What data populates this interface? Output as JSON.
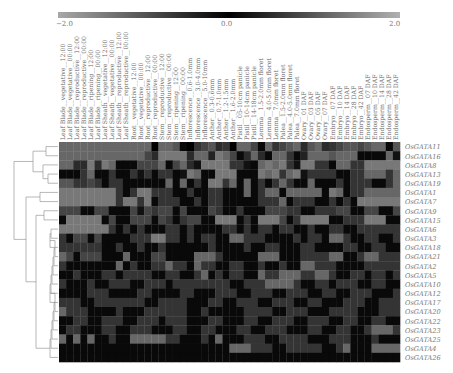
{
  "chart_data": {
    "type": "heatmap",
    "title": "",
    "colorbar": {
      "min": -2.0,
      "max": 2.0,
      "ticks": [
        "−2.0",
        "0.0",
        "2.0"
      ],
      "colormap": "gray-black-gray",
      "low_color": "#a8a8a8",
      "mid_color": "#000000",
      "high_color": "#b0b0b0"
    },
    "columns": [
      "Leaf Blade_vegetative_12:00",
      "Leaf Blade_vegetative_00:00",
      "Leaf Blade_reproductive_12:00",
      "Leaf Blade_reproductive_00:00",
      "Leaf Blade_ripening_12:00",
      "Leaf Blade_ripening_00:00",
      "Leaf Sheath_vegetative_12:00",
      "Leaf Sheath_vegetative_00:00",
      "Leaf Sheath_reproductive_12:00",
      "Leaf Sheath_reproductive_00:00",
      "Root_vegetative_12:00",
      "Root_vegetative_00:00",
      "Root_reproductive_12:00",
      "Root_reproductive_00:00",
      "Stem_reproductive_12:00",
      "Stem_reproductive_00:00",
      "Stem_ripening_12:00",
      "Stem_ripening_00:00",
      "Inflorescence_0.6-1.0mm",
      "Inflorescence_3.0-4.0mm",
      "Inflorescence_5.0-10mm",
      "Anther_0.3-0.6mm",
      "Anther_0.7-1.0mm",
      "Anther_1.2-1.5mm",
      "Anther_1.6-2.0mm",
      "Pistil_05-10cm panicle",
      "Pistil_10-14cm panicle",
      "Pistil_14-18cm panicle",
      "Lemma_1.5-2.0mm floret",
      "Lemma_4.0-5.0mm floret",
      "Lemma_7.0mm floret",
      "Palea_1.5-2.0mm floret",
      "Palea_4.0-5.0mm floret",
      "Palea_7.0mm floret",
      "Ovary_01 DAF",
      "Ovary_03 DAF",
      "Ovary_05 DAF",
      "Ovary_07 DAF",
      "Embryo_07 DAF",
      "Embryo_10 DAF",
      "Embryo_14 DAF",
      "Embryo_28 DAF",
      "Embryo_42 DAF",
      "Endosperm_07 DAF",
      "Endosperm_10 DAF",
      "Endosperm_14 DAF",
      "Endosperm_28 DAF",
      "Endosperm_42 DAF"
    ],
    "rows": [
      "OsGATA11",
      "OsGATA16",
      "OsGATA8",
      "OsGATA13",
      "OsGATA19",
      "OsGATA1",
      "OsGATA7",
      "OsGATA9",
      "OsGATA15",
      "OsGATA6",
      "OsGATA3",
      "OsGATA18",
      "OsGATA21",
      "OsGATA2",
      "OsGATA5",
      "OsGATA10",
      "OsGATA12",
      "OsGATA17",
      "OsGATA20",
      "OsGATA22",
      "OsGATA23",
      "OsGATA25",
      "OsGATA4",
      "OsGATA26"
    ],
    "values": [
      [
        -1.2,
        -1.2,
        -1.2,
        -1.2,
        -1.2,
        -1.2,
        -1.2,
        -1.2,
        -1.2,
        -1.2,
        -1.2,
        -1.2,
        -1.2,
        0.0,
        -1.2,
        -1.2,
        -1.0,
        0.1,
        0.0,
        -0.6,
        -0.8,
        -1.0,
        -0.5,
        -0.6,
        0.0,
        -1.2,
        -1.2,
        -0.8,
        0.1,
        -1.2,
        -0.6,
        -0.8,
        -1.0,
        -1.2,
        -0.5,
        -1.0,
        -1.2,
        -0.5,
        -0.6,
        -0.8,
        -1.0,
        -1.0,
        -0.8,
        -1.0,
        -1.2,
        -1.2,
        -0.1,
        -1.0
      ],
      [
        -1.2,
        -1.2,
        -1.2,
        -1.2,
        -1.2,
        -1.2,
        -1.2,
        -1.2,
        -1.2,
        -1.2,
        -1.2,
        -1.2,
        -0.8,
        -0.5,
        -1.4,
        -1.4,
        -1.4,
        -1.4,
        -0.5,
        -1.2,
        -1.2,
        -0.4,
        -1.4,
        -1.2,
        -0.8,
        -0.1,
        -0.5,
        -1.2,
        -0.5,
        -0.1,
        -1.2,
        -1.2,
        -0.6,
        -0.1,
        -0.4,
        -1.2,
        -1.2,
        -1.2,
        -1.0,
        -1.2,
        -1.2,
        -1.2,
        -0.1,
        -0.1,
        -0.1,
        -0.1,
        -1.2,
        -0.2
      ],
      [
        -1.2,
        -1.2,
        -0.5,
        -0.5,
        -1.4,
        -0.5,
        -1.4,
        -1.2,
        -0.1,
        -0.1,
        -0.1,
        -0.8,
        -0.8,
        -0.8,
        -1.2,
        -0.1,
        -0.8,
        -1.2,
        -0.5,
        -0.2,
        -1.4,
        -1.4,
        -1.4,
        -1.4,
        -0.6,
        -0.6,
        -0.2,
        -0.1,
        -1.2,
        -1.4,
        -1.2,
        -1.4,
        -0.6,
        -0.2,
        -1.4,
        -1.4,
        -0.6,
        -0.6,
        -0.1,
        -1.2,
        -1.2,
        -0.6,
        -0.6,
        -1.4,
        -1.4,
        -1.4,
        -1.4,
        -1.4
      ],
      [
        -0.1,
        -0.1,
        -0.1,
        -0.6,
        -1.2,
        -0.1,
        -0.1,
        -0.6,
        -0.1,
        -0.1,
        -0.6,
        -0.2,
        -0.6,
        -0.1,
        -0.6,
        -0.6,
        -0.1,
        -0.2,
        -1.4,
        -1.2,
        -0.1,
        -0.1,
        -1.4,
        -1.4,
        -1.4,
        -0.1,
        -0.1,
        -0.1,
        -1.4,
        -1.2,
        -1.4,
        -0.6,
        -1.2,
        -1.4,
        -0.2,
        -0.6,
        -0.6,
        -0.6,
        -0.6,
        -0.1,
        -0.1,
        -0.6,
        -0.6,
        -1.2,
        -1.2,
        -1.2,
        -0.6,
        -1.2
      ],
      [
        -1.0,
        -1.0,
        -0.6,
        -0.6,
        -0.8,
        -0.6,
        -0.1,
        -0.6,
        -0.6,
        -0.1,
        -0.1,
        -0.1,
        -0.1,
        -0.1,
        -0.1,
        -1.2,
        -0.1,
        -1.2,
        -0.1,
        -0.6,
        -0.1,
        -1.4,
        -1.4,
        -0.6,
        -1.2,
        -0.1,
        -1.2,
        -0.1,
        -0.6,
        -0.1,
        -0.6,
        -1.2,
        -0.6,
        -0.1,
        -0.1,
        -1.2,
        -0.1,
        -0.1,
        -0.1,
        -0.6,
        -0.1,
        -0.6,
        -0.6,
        -0.6,
        -0.1,
        -0.1,
        -0.6,
        -1.2
      ],
      [
        -1.4,
        -1.4,
        -1.4,
        -1.4,
        -1.4,
        -1.4,
        -1.4,
        -1.4,
        -0.6,
        -0.1,
        -0.6,
        -1.4,
        -1.4,
        -0.6,
        -0.6,
        -0.6,
        -0.1,
        -0.1,
        -0.6,
        -0.1,
        -0.1,
        -0.6,
        -0.6,
        -0.1,
        -0.1,
        -0.1,
        -1.2,
        -0.1,
        -0.6,
        -1.2,
        -1.2,
        -0.1,
        -1.2,
        -1.2,
        -1.2,
        -1.2,
        -1.2,
        -0.1,
        -1.4,
        -1.2,
        -0.1,
        -0.6,
        -0.6,
        -1.2,
        -1.2,
        -1.2,
        -1.2,
        -1.2
      ],
      [
        -1.4,
        -1.4,
        -1.4,
        -1.4,
        -1.4,
        -1.4,
        -1.4,
        -1.4,
        -0.6,
        -1.4,
        -1.4,
        -0.6,
        -1.4,
        -0.1,
        -0.6,
        -0.6,
        -0.6,
        -0.1,
        -0.1,
        -0.6,
        -0.1,
        -0.6,
        -0.6,
        -0.1,
        -0.1,
        -0.1,
        -0.1,
        -0.1,
        -0.6,
        -0.6,
        -0.6,
        -1.2,
        -0.1,
        -0.6,
        -0.6,
        -0.6,
        -0.1,
        -0.1,
        -0.6,
        -0.1,
        -0.6,
        -0.1,
        -1.4,
        -1.4,
        -1.4,
        -1.4,
        -1.4,
        -1.4
      ],
      [
        -0.8,
        -0.8,
        -0.8,
        -0.1,
        -0.1,
        -0.8,
        -0.8,
        -0.1,
        -0.1,
        -0.1,
        -0.8,
        -0.2,
        -0.8,
        -0.6,
        -0.8,
        -0.8,
        -0.1,
        -0.8,
        -0.1,
        -0.1,
        -0.1,
        -0.8,
        -0.6,
        -0.1,
        -0.1,
        -0.6,
        -0.1,
        -0.1,
        -0.1,
        -0.8,
        -0.8,
        -0.8,
        -0.6,
        -0.6,
        -0.1,
        -0.1,
        -0.6,
        -0.6,
        -0.6,
        -0.8,
        -0.8,
        -0.1,
        -0.1,
        -0.8,
        -0.8,
        -0.1,
        -0.1,
        -0.8
      ],
      [
        -0.1,
        -1.4,
        -1.4,
        -1.4,
        -1.4,
        -1.4,
        -0.1,
        -0.8,
        -0.1,
        -0.1,
        -0.8,
        -0.8,
        -0.8,
        -0.1,
        -0.8,
        -0.6,
        -0.1,
        -0.6,
        -0.8,
        -0.8,
        -0.1,
        -0.1,
        -1.4,
        -1.4,
        -1.4,
        -0.1,
        -0.6,
        -0.1,
        -1.4,
        -1.4,
        -1.4,
        -0.8,
        -0.1,
        -0.6,
        -1.4,
        -1.4,
        -1.4,
        -1.4,
        -0.1,
        -0.1,
        -0.6,
        -0.6,
        -0.6,
        -1.4,
        -1.4,
        -1.4,
        -0.1,
        -0.1
      ],
      [
        -1.4,
        -1.4,
        -1.4,
        -1.4,
        -1.4,
        -1.4,
        -1.4,
        -0.6,
        -0.1,
        -0.6,
        -0.1,
        -0.6,
        -0.1,
        -0.1,
        -0.1,
        -0.6,
        -0.6,
        -0.1,
        -0.6,
        -0.1,
        -0.1,
        -0.1,
        -0.1,
        -0.6,
        -0.6,
        -0.1,
        -0.6,
        -0.1,
        -0.6,
        -0.6,
        -0.1,
        -0.6,
        -0.6,
        -0.1,
        -0.1,
        -0.6,
        -0.1,
        -0.1,
        -0.6,
        -0.6,
        -0.1,
        -0.1,
        -0.6,
        -0.6,
        -0.6,
        -0.6,
        -0.6,
        -0.6
      ],
      [
        -0.6,
        -0.1,
        -0.8,
        -0.8,
        -0.1,
        -0.8,
        -0.1,
        -0.1,
        -0.1,
        -0.1,
        -0.6,
        -0.6,
        -0.6,
        -1.4,
        -1.4,
        -0.6,
        -0.6,
        -0.1,
        -0.6,
        -0.1,
        -0.6,
        -0.6,
        -0.1,
        -0.1,
        -1.2,
        -1.2,
        -0.6,
        -0.6,
        -0.6,
        -0.1,
        -0.1,
        -0.1,
        -0.1,
        -0.6,
        -0.1,
        -0.6,
        -0.6,
        -0.1,
        -1.2,
        -1.2,
        -0.6,
        -0.1,
        -0.1,
        -0.6,
        -0.6,
        -0.1,
        -0.1,
        -0.6
      ],
      [
        -0.6,
        -0.6,
        -0.6,
        -0.6,
        -0.6,
        -0.6,
        -0.1,
        -0.1,
        -0.6,
        -0.1,
        -0.1,
        -0.6,
        -0.1,
        -0.1,
        -0.6,
        -0.1,
        -0.1,
        -0.1,
        -0.1,
        -0.1,
        -0.1,
        -0.6,
        -0.1,
        -0.1,
        -0.1,
        -0.1,
        -0.6,
        -0.1,
        -0.1,
        -0.6,
        -0.6,
        -0.1,
        -0.1,
        -0.1,
        -0.6,
        -0.6,
        -0.1,
        -0.1,
        -0.1,
        -0.1,
        -0.6,
        -0.6,
        -0.1,
        -0.1,
        -0.6,
        -0.6,
        -0.1,
        -0.1
      ],
      [
        -1.2,
        -0.8,
        -0.1,
        -0.8,
        -0.8,
        -0.8,
        -0.1,
        -0.1,
        -0.1,
        -1.2,
        -0.1,
        -0.1,
        -0.1,
        -0.8,
        -0.8,
        -0.1,
        -0.1,
        -0.1,
        -0.1,
        -1.2,
        -1.2,
        -1.2,
        -0.6,
        -0.1,
        -0.1,
        -0.1,
        -0.1,
        -0.1,
        -1.2,
        -1.2,
        -1.2,
        -0.1,
        -0.1,
        -0.1,
        -0.6,
        -0.6,
        -0.6,
        -0.6,
        -1.2,
        -1.2,
        -0.1,
        -0.1,
        -0.6,
        -1.2,
        -1.2,
        -0.6,
        -0.6,
        -0.6
      ],
      [
        -0.6,
        -0.1,
        -0.1,
        -0.1,
        -0.1,
        -0.1,
        -0.1,
        -0.1,
        -1.2,
        -0.1,
        -0.6,
        -0.1,
        -0.1,
        -0.6,
        -0.6,
        -1.2,
        -0.6,
        -0.6,
        -0.1,
        -1.2,
        -0.6,
        -0.6,
        -0.1,
        -0.1,
        -0.6,
        -0.6,
        -0.1,
        -0.1,
        -0.6,
        -0.1,
        -0.1,
        -0.6,
        -0.1,
        -0.1,
        -1.2,
        -1.2,
        -0.6,
        -0.6,
        -0.6,
        -0.1,
        -0.1,
        -0.1,
        -0.1,
        -0.6,
        -0.6,
        -0.6,
        -0.6,
        -0.6
      ],
      [
        -0.1,
        -0.1,
        -0.6,
        -0.1,
        -0.1,
        -0.1,
        -0.6,
        -0.6,
        -0.1,
        -0.6,
        -0.6,
        -0.6,
        -0.6,
        -0.1,
        -0.1,
        -0.6,
        -0.6,
        -0.1,
        -0.1,
        -0.6,
        -1.2,
        -0.1,
        -0.6,
        -0.1,
        -0.6,
        -0.6,
        -0.1,
        -0.1,
        -1.2,
        -0.6,
        -0.6,
        -1.2,
        -1.2,
        -1.2,
        -0.6,
        -0.6,
        -1.2,
        -1.2,
        -0.6,
        -0.1,
        -0.1,
        -0.6,
        -0.6,
        -0.1,
        -0.6,
        -0.6,
        -0.1,
        -0.6
      ],
      [
        -0.6,
        -0.1,
        -0.1,
        -0.1,
        -0.6,
        -0.1,
        -0.1,
        -0.6,
        -0.6,
        -0.6,
        -0.1,
        -0.1,
        -0.6,
        -0.6,
        -0.6,
        -0.1,
        -0.6,
        -0.6,
        -0.6,
        -0.6,
        -0.6,
        -0.6,
        -0.6,
        -0.6,
        -0.1,
        -0.1,
        -0.6,
        -0.6,
        -0.6,
        -1.2,
        -1.2,
        -1.2,
        -1.2,
        -0.6,
        -0.1,
        -0.1,
        -0.6,
        -0.6,
        -0.1,
        -0.6,
        -0.6,
        -0.6,
        -0.1,
        -0.1,
        -0.6,
        -0.6,
        -0.1,
        -0.1
      ],
      [
        -0.1,
        -0.1,
        -0.1,
        -0.1,
        -0.6,
        -0.6,
        -0.6,
        -0.1,
        -0.1,
        -0.1,
        -0.1,
        -0.6,
        -0.6,
        -0.1,
        -0.1,
        -0.1,
        -0.1,
        -0.6,
        -0.6,
        -0.1,
        -0.1,
        -0.1,
        -0.6,
        -0.6,
        -0.6,
        -0.1,
        -0.1,
        -0.6,
        -0.6,
        -0.6,
        -0.1,
        -0.1,
        -0.6,
        -0.6,
        -0.6,
        -0.1,
        -0.1,
        -0.6,
        -0.6,
        -0.1,
        -0.1,
        -0.6,
        -0.6,
        -0.6,
        -0.1,
        -0.1,
        -0.1,
        -0.6
      ],
      [
        -0.6,
        -0.6,
        -0.6,
        -0.1,
        -0.1,
        -0.6,
        -0.6,
        -0.6,
        -0.6,
        -0.6,
        -0.6,
        -0.6,
        -0.1,
        -0.1,
        -0.6,
        -0.6,
        -0.6,
        -0.6,
        -0.1,
        -0.1,
        -0.1,
        -0.6,
        -0.6,
        -0.1,
        -0.1,
        -0.6,
        -0.6,
        -0.6,
        -0.1,
        -0.1,
        -0.6,
        -0.6,
        -0.6,
        -0.1,
        -0.1,
        -0.6,
        -0.6,
        -0.1,
        -0.1,
        -0.1,
        -0.6,
        -0.6,
        -0.6,
        -0.1,
        -0.1,
        -0.6,
        -0.6,
        -0.6
      ],
      [
        -1.2,
        -0.6,
        -0.6,
        -0.6,
        -0.1,
        -0.1,
        -0.1,
        -0.1,
        -0.6,
        -0.1,
        -0.1,
        -0.1,
        -0.6,
        -0.6,
        -0.6,
        -0.6,
        -0.6,
        -0.6,
        -0.1,
        -0.1,
        -0.6,
        -0.1,
        -0.1,
        -0.1,
        -0.1,
        -0.1,
        -0.6,
        -0.6,
        -0.6,
        -0.6,
        -0.1,
        -0.1,
        -0.6,
        -0.6,
        -0.6,
        -0.1,
        -0.1,
        -0.1,
        -0.6,
        -0.6,
        -0.6,
        -0.6,
        -0.1,
        -0.1,
        -0.1,
        -0.6,
        -0.6,
        -0.6
      ],
      [
        -0.1,
        -0.1,
        -0.6,
        -0.6,
        -0.1,
        -0.1,
        -0.6,
        -0.6,
        -0.6,
        -0.1,
        -0.1,
        -0.6,
        -0.6,
        -0.6,
        -0.1,
        -0.6,
        -0.6,
        -0.6,
        -0.1,
        -0.1,
        -0.1,
        -0.6,
        -0.6,
        -0.1,
        -0.1,
        -0.1,
        -0.6,
        -0.6,
        -0.1,
        -0.1,
        -0.6,
        -0.6,
        -0.6,
        -0.1,
        -0.1,
        -0.6,
        -0.6,
        -0.6,
        -0.1,
        -0.1,
        -0.6,
        -0.6,
        -0.1,
        -0.1,
        -0.6,
        -0.6,
        -0.1,
        -0.1
      ],
      [
        -0.1,
        -0.6,
        -0.6,
        -0.1,
        -0.1,
        -0.1,
        -0.6,
        -0.6,
        -0.1,
        -0.1,
        -0.6,
        -0.6,
        -0.6,
        -0.1,
        -0.1,
        -0.1,
        -0.6,
        -0.6,
        -0.1,
        -0.1,
        -0.6,
        -0.6,
        -0.1,
        -0.1,
        -0.1,
        -0.6,
        -0.6,
        -0.1,
        -0.1,
        -0.6,
        -0.6,
        -0.6,
        -0.1,
        -0.1,
        -0.1,
        -0.6,
        -0.6,
        -0.1,
        -0.1,
        -0.6,
        -0.6,
        -0.1,
        -0.1,
        -0.6,
        -1.2,
        -1.2,
        -1.2,
        -0.6
      ],
      [
        -1.2,
        -0.1,
        -1.2,
        -0.1,
        -1.2,
        -0.1,
        -0.1,
        -0.6,
        -0.1,
        -0.1,
        -1.2,
        -1.2,
        -1.2,
        -1.2,
        -1.2,
        -0.6,
        -0.6,
        -0.1,
        -0.1,
        -0.1,
        -0.6,
        -0.1,
        -1.2,
        -0.1,
        -0.1,
        -0.1,
        -0.6,
        -0.6,
        -0.6,
        -0.1,
        -0.1,
        -0.6,
        -0.6,
        -0.6,
        -0.6,
        -0.1,
        -0.1,
        -0.1,
        -0.6,
        -0.6,
        -0.6,
        -0.1,
        -0.1,
        -0.1,
        -0.6,
        -0.1,
        -0.1,
        -0.1
      ],
      [
        -0.1,
        -0.1,
        -0.1,
        -0.1,
        -0.1,
        -0.1,
        -0.1,
        -0.1,
        -0.1,
        -0.1,
        -0.1,
        -0.1,
        -0.1,
        -0.1,
        -0.1,
        -0.1,
        -0.1,
        -0.1,
        -0.1,
        -0.1,
        -0.1,
        -0.1,
        -0.1,
        -0.1,
        -1.2,
        -1.2,
        -1.2,
        -0.6,
        -0.6,
        -0.6,
        -0.1,
        -0.1,
        -0.6,
        -0.6,
        -0.6,
        -0.6,
        -0.6,
        -0.1,
        -0.1,
        -0.6,
        -1.2,
        -0.1,
        -0.1,
        -0.1,
        -1.2,
        -1.2,
        -1.2,
        -1.2
      ],
      [
        -0.1,
        -0.1,
        -0.1,
        -0.1,
        -0.1,
        -0.1,
        -0.1,
        -0.1,
        -0.1,
        -0.1,
        -0.1,
        -0.1,
        -0.1,
        -0.1,
        -0.1,
        -0.1,
        -0.1,
        -0.1,
        -0.1,
        -0.1,
        -0.1,
        -0.1,
        -0.1,
        -0.1,
        -0.1,
        -0.1,
        -0.1,
        -0.1,
        -0.1,
        -0.1,
        -0.1,
        -0.1,
        -0.1,
        -0.1,
        -0.1,
        -0.1,
        -0.1,
        -0.1,
        -0.1,
        -0.1,
        -0.1,
        -0.1,
        -0.1,
        -0.1,
        -0.1,
        -0.1,
        -0.1,
        -0.1
      ]
    ],
    "row_dendrogram": "hierarchical clustering tree on left side",
    "xlabel": "",
    "ylabel": ""
  }
}
